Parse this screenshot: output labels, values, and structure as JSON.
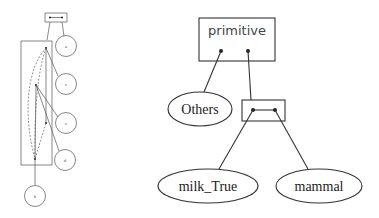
{
  "left_diagram": {
    "nodes": [
      {
        "id": "a",
        "label": "a"
      },
      {
        "id": "c1",
        "label": "c"
      },
      {
        "id": "c2",
        "label": "c"
      },
      {
        "id": "d",
        "label": "d"
      },
      {
        "id": "b",
        "label": "b"
      }
    ]
  },
  "right_diagram": {
    "root": {
      "label": "primitive"
    },
    "nodes": {
      "others": {
        "label": "Others"
      },
      "milk_true": {
        "label": "milk_True"
      },
      "mammal": {
        "label": "mammal"
      }
    }
  }
}
